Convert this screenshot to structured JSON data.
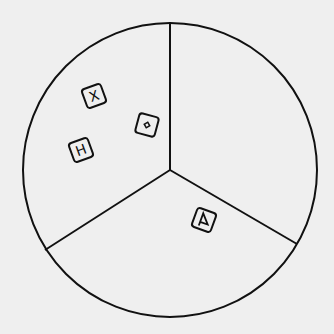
{
  "diagram": {
    "type": "circle-divided-into-three-sectors",
    "background": "#efefef",
    "stroke": "#111111",
    "circle": {
      "cx": 170,
      "cy": 170,
      "r": 147
    },
    "center": {
      "x": 170,
      "y": 170
    },
    "dividers": [
      {
        "name": "top",
        "x2": 170,
        "y2": 23
      },
      {
        "name": "lower-left",
        "x2": 45,
        "y2": 250
      },
      {
        "name": "lower-right",
        "x2": 297,
        "y2": 244
      }
    ],
    "tiles": [
      {
        "name": "tile-x",
        "symbol": "X",
        "x": 94,
        "y": 96,
        "rotate": -20
      },
      {
        "name": "tile-diamond",
        "symbol": "◆",
        "x": 147,
        "y": 125,
        "rotate": 15
      },
      {
        "name": "tile-h",
        "symbol": "H",
        "x": 81,
        "y": 150,
        "rotate": -20
      },
      {
        "name": "tile-flag",
        "symbol": "A",
        "x": 204,
        "y": 220,
        "rotate": 20
      }
    ]
  }
}
